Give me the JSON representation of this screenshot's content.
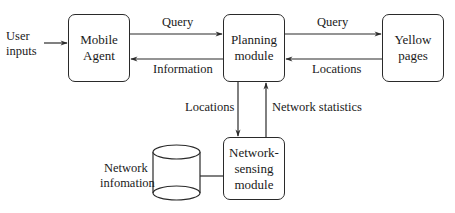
{
  "diagram": {
    "nodes": {
      "mobile_agent": "Mobile Agent",
      "planning_module": "Planning module",
      "yellow_pages": "Yellow pages",
      "network_sensing_module": "Network-sensing module",
      "network_information_store": "Network infomation"
    },
    "node_lines": {
      "mobile_agent": [
        "Mobile",
        "Agent"
      ],
      "planning_module": [
        "Planning",
        "module"
      ],
      "yellow_pages": [
        "Yellow",
        "pages"
      ],
      "network_sensing_module": [
        "Network-",
        "sensing",
        "module"
      ],
      "network_information_store": [
        "Network",
        "infomation"
      ]
    },
    "input_label": [
      "User",
      "inputs"
    ],
    "edges": [
      {
        "from": "User inputs",
        "to": "Mobile Agent",
        "label": ""
      },
      {
        "from": "Mobile Agent",
        "to": "Planning module",
        "label": "Query"
      },
      {
        "from": "Planning module",
        "to": "Mobile Agent",
        "label": "Information"
      },
      {
        "from": "Planning module",
        "to": "Yellow pages",
        "label": "Query"
      },
      {
        "from": "Yellow pages",
        "to": "Planning module",
        "label": "Locations"
      },
      {
        "from": "Planning module",
        "to": "Network-sensing module",
        "label": "Locations"
      },
      {
        "from": "Network-sensing module",
        "to": "Planning module",
        "label": "Network statistics"
      },
      {
        "from": "Network-sensing module",
        "to": "Network infomation",
        "label": ""
      }
    ]
  }
}
